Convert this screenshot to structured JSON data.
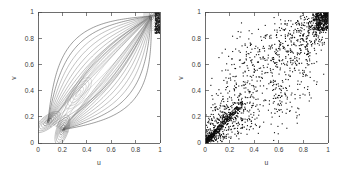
{
  "figure": {
    "background_color": "#ffffff",
    "width": 343,
    "height": 172,
    "panel_count": 2
  },
  "chart_data": [
    {
      "type": "line",
      "subtype": "contour",
      "panel": "left",
      "title": "",
      "xlabel": "u",
      "ylabel": "v",
      "xlim": [
        0,
        1
      ],
      "ylim": [
        0,
        1
      ],
      "xticks": [
        0,
        0.2,
        0.4,
        0.6,
        0.8,
        1
      ],
      "xticklabels": [
        "0",
        "0.2",
        "0.4",
        "0.6",
        "0.8",
        "1"
      ],
      "yticks": [
        0,
        0.2,
        0.4,
        0.6,
        0.8,
        1
      ],
      "yticklabels": [
        "0",
        "0.2",
        "0.4",
        "0.6",
        "0.8",
        "1"
      ],
      "grid": false,
      "legend": false,
      "legend_position": "none",
      "line_color": "#6b6b6b",
      "description": "Copula density contour lines forming a lens/leaf shaped bundle of curves fanning out between two attractor regions in the lower-left and an attractor near the upper-right corner",
      "contour_levels": 12,
      "focus_points": [
        {
          "u": 0.08,
          "v": 0.16,
          "label": "lower-left convergence"
        },
        {
          "u": 0.2,
          "v": 0.1,
          "label": "lower convergence"
        },
        {
          "u": 0.33,
          "v": 0.38,
          "label": "inner closed loops"
        },
        {
          "u": 0.93,
          "v": 0.97,
          "label": "upper-right convergence"
        }
      ],
      "dense_corner": {
        "u": 1.0,
        "v": 1.0
      }
    },
    {
      "type": "scatter",
      "panel": "right",
      "title": "",
      "xlabel": "u",
      "ylabel": "v",
      "xlim": [
        0,
        1
      ],
      "ylim": [
        0,
        1
      ],
      "xticks": [
        0,
        0.2,
        0.4,
        0.6,
        0.8,
        1
      ],
      "xticklabels": [
        "0",
        "0.2",
        "0.4",
        "0.6",
        "0.8",
        "1"
      ],
      "yticks": [
        0,
        0.2,
        0.4,
        0.6,
        0.8,
        1
      ],
      "yticklabels": [
        "0",
        "0.2",
        "0.4",
        "0.6",
        "0.8",
        "1"
      ],
      "grid": false,
      "legend": false,
      "legend_position": "none",
      "marker_color": "#0d0d0d",
      "marker_size": 1.1,
      "n_points": 2000,
      "description": "Simulated copula sample: strongly positively dependent cloud, extremely dense along the diagonal near the origin and saturated solid black in the upper-right corner, thinning toward the lower-right and upper-left",
      "dependence": "positive",
      "tail_dependence": [
        "lower",
        "upper"
      ]
    }
  ],
  "panels": {
    "left": {
      "name": "contour-plot",
      "xlabel": "u",
      "ylabel": "v",
      "xticklabels": [
        "0",
        "0.2",
        "0.4",
        "0.6",
        "0.8",
        "1"
      ],
      "yticklabels": [
        "0",
        "0.2",
        "0.4",
        "0.6",
        "0.8",
        "1"
      ]
    },
    "right": {
      "name": "scatter-plot",
      "xlabel": "u",
      "ylabel": "v",
      "xticklabels": [
        "0",
        "0.2",
        "0.4",
        "0.6",
        "0.8",
        "1"
      ],
      "yticklabels": [
        "0",
        "0.2",
        "0.4",
        "0.6",
        "0.8",
        "1"
      ]
    }
  }
}
